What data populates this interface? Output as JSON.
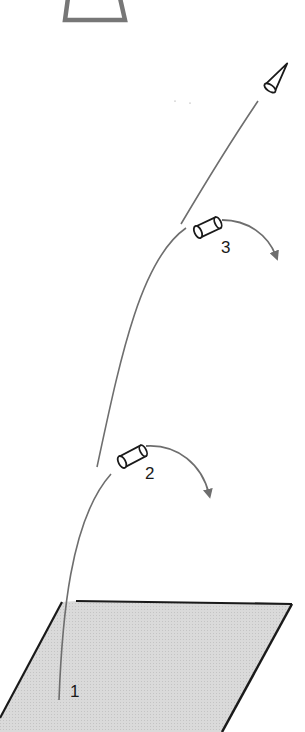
{
  "diagram": {
    "type": "multistage-rocket-launch",
    "stages": [
      {
        "id": "stage-1",
        "label": "1",
        "description": "launch from ground"
      },
      {
        "id": "stage-2",
        "label": "2",
        "description": "first spent stage separates and falls away"
      },
      {
        "id": "stage-3",
        "label": "3",
        "description": "second spent stage separates and falls away"
      }
    ],
    "colors": {
      "trajectory": "#6e6e6e",
      "arrow": "#6e6e6e",
      "outline": "#1a1a1a",
      "ground_fill": "#d4d4d4",
      "top_shape": "#777777"
    }
  }
}
